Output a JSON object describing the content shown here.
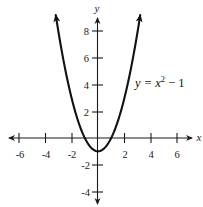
{
  "chart_data": {
    "type": "line",
    "title": "",
    "xlabel": "x",
    "ylabel": "y",
    "xlim": [
      -6.8,
      7.2
    ],
    "ylim": [
      -5,
      9.1
    ],
    "grid": false,
    "x_ticks": [
      -6,
      -4,
      -2,
      2,
      4,
      6
    ],
    "x_tick_labels": [
      "-6",
      "-4",
      "-2",
      "2",
      "4",
      "6"
    ],
    "y_ticks": [
      8,
      6,
      4,
      2,
      -2,
      -4
    ],
    "y_tick_labels": [
      "8",
      "6",
      "4",
      "2",
      "-2",
      "-4"
    ],
    "minor_x_ticks": [
      -5,
      -3,
      -1,
      1,
      3,
      5
    ],
    "series": [
      {
        "name": "y = x^2 - 1",
        "function": "x^2 - 1",
        "x": [
          -3.2,
          -3,
          -2.5,
          -2,
          -1.5,
          -1,
          -0.5,
          0,
          0.5,
          1,
          1.5,
          2,
          2.5,
          3,
          3.2
        ],
        "y": [
          9.24,
          8,
          5.25,
          3,
          1.25,
          0,
          -0.75,
          -1,
          -0.75,
          0,
          1.25,
          3,
          5.25,
          8,
          9.24
        ],
        "arrows_at_ends": true
      }
    ],
    "annotations": [
      {
        "text": "y = x² − 1",
        "x": 3.5,
        "y": 3.8
      }
    ]
  },
  "labels": {
    "x_axis": "x",
    "y_axis": "y",
    "equation_prefix": "y = ",
    "equation_var": "x",
    "equation_exp": "2",
    "equation_suffix": " − 1",
    "x_ticks": [
      "-6",
      "-4",
      "-2",
      "2",
      "4",
      "6"
    ],
    "y_ticks": [
      "8",
      "6",
      "4",
      "2",
      "-2",
      "-4"
    ]
  },
  "colors": {
    "curve": "#111111",
    "axis": "#1a1a1a",
    "background": "#ffffff"
  }
}
